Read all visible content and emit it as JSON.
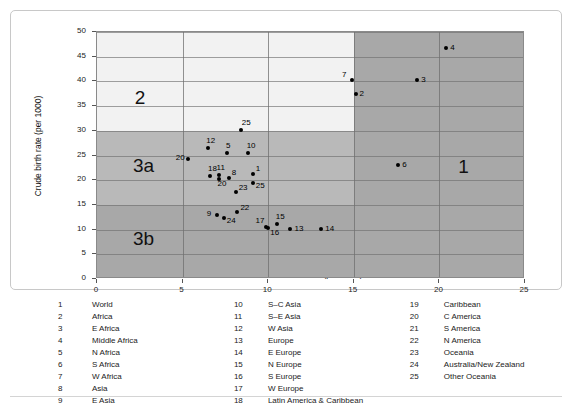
{
  "chart_data": {
    "type": "scatter",
    "title": "",
    "xlabel": "Crude death rate (per 1000)",
    "ylabel": "Crude birth rate (per 1000)",
    "xlim": [
      0,
      25
    ],
    "ylim": [
      0,
      50
    ],
    "xticks": [
      0,
      5,
      10,
      15,
      20,
      25
    ],
    "yticks": [
      0,
      5,
      10,
      15,
      20,
      25,
      30,
      35,
      40,
      45,
      50
    ],
    "grid": true,
    "legend_position": "below-plot",
    "points": [
      {
        "id": "1",
        "label": "1",
        "x": 9.1,
        "y": 21.3,
        "label_dx": 3,
        "label_dy": -9
      },
      {
        "id": "2",
        "label": "2",
        "x": 15.1,
        "y": 37.4,
        "label_dx": 4,
        "label_dy": -4
      },
      {
        "id": "3",
        "label": "3",
        "x": 18.7,
        "y": 40.2,
        "label_dx": 4,
        "label_dy": -4
      },
      {
        "id": "4",
        "label": "4",
        "x": 20.4,
        "y": 46.8,
        "label_dx": 4,
        "label_dy": -4
      },
      {
        "id": "5",
        "label": "5",
        "x": 7.6,
        "y": 25.6,
        "label_dx": -1,
        "label_dy": -11
      },
      {
        "id": "6",
        "label": "6",
        "x": 17.6,
        "y": 23.1,
        "label_dx": 4,
        "label_dy": -4
      },
      {
        "id": "7",
        "label": "7",
        "x": 14.9,
        "y": 40.2,
        "label_dx": -10,
        "label_dy": -9
      },
      {
        "id": "8",
        "label": "8",
        "x": 7.7,
        "y": 20.5,
        "label_dx": 3,
        "label_dy": -9
      },
      {
        "id": "9",
        "label": "9",
        "x": 7.0,
        "y": 13.0,
        "label_dx": -10,
        "label_dy": -5
      },
      {
        "id": "10",
        "label": "10",
        "x": 8.8,
        "y": 25.5,
        "label_dx": -1,
        "label_dy": -11
      },
      {
        "id": "11",
        "label": "11",
        "x": 7.1,
        "y": 21.1,
        "label_dx": -2,
        "label_dy": -11
      },
      {
        "id": "12",
        "label": "12",
        "x": 6.5,
        "y": 26.5,
        "label_dx": -2,
        "label_dy": -11
      },
      {
        "id": "13",
        "label": "13",
        "x": 11.3,
        "y": 10.2,
        "label_dx": 4,
        "label_dy": -4
      },
      {
        "id": "14",
        "label": "14",
        "x": 13.1,
        "y": 10.1,
        "label_dx": 4,
        "label_dy": -4
      },
      {
        "id": "15",
        "label": "15",
        "x": 10.5,
        "y": 11.2,
        "label_dx": -1,
        "label_dy": -11
      },
      {
        "id": "16",
        "label": "16",
        "x": 10.0,
        "y": 10.3,
        "label_dx": 2,
        "label_dy": 1
      },
      {
        "id": "17",
        "label": "17",
        "x": 9.9,
        "y": 10.6,
        "label_dx": -11,
        "label_dy": -10
      },
      {
        "id": "18",
        "label": "18",
        "x": 6.6,
        "y": 20.8,
        "label_dx": -2,
        "label_dy": -11
      },
      {
        "id": "20",
        "label": "20",
        "x": 5.3,
        "y": 24.2,
        "label_dx": -12,
        "label_dy": -5
      },
      {
        "id": "20b",
        "label": "20",
        "x": 7.1,
        "y": 20.2,
        "label_dx": -1,
        "label_dy": 1
      },
      {
        "id": "22",
        "label": "22",
        "x": 8.2,
        "y": 13.5,
        "label_dx": 3,
        "label_dy": -8
      },
      {
        "id": "23",
        "label": "23",
        "x": 8.1,
        "y": 17.6,
        "label_dx": 3,
        "label_dy": -8
      },
      {
        "id": "24",
        "label": "24",
        "x": 7.4,
        "y": 12.3,
        "label_dx": 3,
        "label_dy": -1
      },
      {
        "id": "25",
        "label": "25",
        "x": 8.4,
        "y": 30.1,
        "label_dx": 1,
        "label_dy": -11
      },
      {
        "id": "25b",
        "label": "25",
        "x": 9.1,
        "y": 19.5,
        "label_dx": 3,
        "label_dy": -1
      }
    ],
    "zones": [
      {
        "name": "2",
        "x": 2.2,
        "y": 36.5
      },
      {
        "name": "3a",
        "x": 2.1,
        "y": 22.6
      },
      {
        "name": "3b",
        "x": 2.1,
        "y": 7.8
      },
      {
        "name": "1",
        "x": 21.1,
        "y": 22.4
      }
    ],
    "zone_boundaries": {
      "x_split": 15,
      "y_splits": [
        15,
        30
      ]
    },
    "colors": {
      "zone_light": "#f2f2f2",
      "zone_medium": "#b9b9b9",
      "zone_dark": "#a8a8a8",
      "point": "#000000",
      "gridline": "#6f6f6f",
      "frame": "#8a8a8a"
    }
  },
  "legend": {
    "columns": [
      [
        {
          "num": "1",
          "name": "World"
        },
        {
          "num": "2",
          "name": "Africa"
        },
        {
          "num": "3",
          "name": "E Africa"
        },
        {
          "num": "4",
          "name": "Middle Africa"
        },
        {
          "num": "5",
          "name": "N Africa"
        },
        {
          "num": "6",
          "name": "S Africa"
        },
        {
          "num": "7",
          "name": "W Africa"
        },
        {
          "num": "8",
          "name": "Asia"
        },
        {
          "num": "9",
          "name": "E Asia"
        }
      ],
      [
        {
          "num": "10",
          "name": "S–C Asia"
        },
        {
          "num": "11",
          "name": "S–E Asia"
        },
        {
          "num": "12",
          "name": "W Asia"
        },
        {
          "num": "13",
          "name": "Europe"
        },
        {
          "num": "14",
          "name": "E Europe"
        },
        {
          "num": "15",
          "name": "N Europe"
        },
        {
          "num": "16",
          "name": "S Europe"
        },
        {
          "num": "17",
          "name": "W Europe"
        },
        {
          "num": "18",
          "name": "Latin America & Caribbean"
        }
      ],
      [
        {
          "num": "19",
          "name": "Caribbean"
        },
        {
          "num": "20",
          "name": "C America"
        },
        {
          "num": "21",
          "name": "S America"
        },
        {
          "num": "22",
          "name": "N America"
        },
        {
          "num": "23",
          "name": "Oceania"
        },
        {
          "num": "24",
          "name": "Australia/New Zealand"
        },
        {
          "num": "25",
          "name": "Other Oceania"
        }
      ]
    ]
  }
}
